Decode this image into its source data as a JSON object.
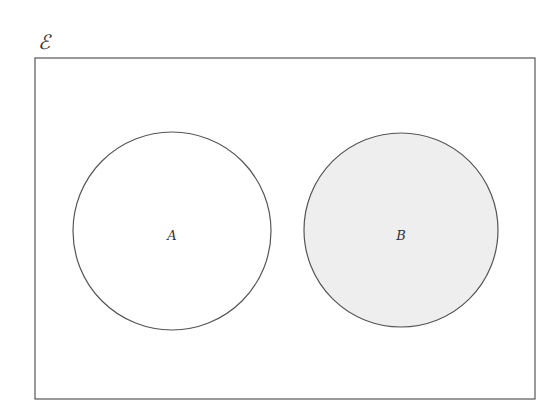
{
  "diagram": {
    "type": "venn",
    "universal_set": {
      "label": "ℰ",
      "x": 35,
      "y": 58,
      "width": 500,
      "height": 341
    },
    "sets": [
      {
        "label": "A",
        "cx": 172,
        "cy": 231,
        "r": 99,
        "fill": "#ffffff",
        "shaded": false
      },
      {
        "label": "B",
        "cx": 401,
        "cy": 230,
        "r": 97,
        "fill": "#eeeeee",
        "shaded": true
      }
    ],
    "stroke_color": "#555555",
    "relationship": "disjoint"
  }
}
